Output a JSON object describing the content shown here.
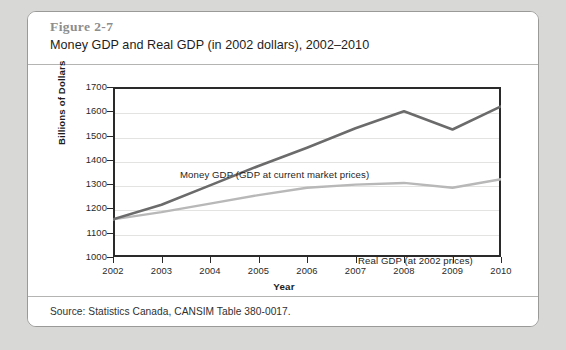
{
  "figure": {
    "number": "Figure 2-7",
    "title": "Money GDP and Real GDP (in 2002 dollars), 2002–2010",
    "source": "Source: Statistics Canada, CANSIM Table 380-0017."
  },
  "chart_data": {
    "type": "line",
    "title": "Money GDP and Real GDP (in 2002 dollars), 2002–2010",
    "xlabel": "Year",
    "ylabel": "Billions of Dollars",
    "categories": [
      2002,
      2003,
      2004,
      2005,
      2006,
      2007,
      2008,
      2009,
      2010
    ],
    "tick_labels_x": [
      "2002",
      "2003",
      "2004",
      "2005",
      "2006",
      "2007",
      "2008",
      "2009",
      "2010"
    ],
    "tick_labels_y": [
      "1000",
      "1100",
      "1200",
      "1300",
      "1400",
      "1500",
      "1600",
      "1700"
    ],
    "ylim": [
      1000,
      1700
    ],
    "ytick_step": 100,
    "grid": true,
    "legend": "inline-annotations",
    "series": [
      {
        "name": "Money GDP (GDP at current market prices)",
        "color": "#6b6b6b",
        "width": 2.6,
        "values": [
          1155,
          1215,
          1295,
          1375,
          1450,
          1530,
          1600,
          1525,
          1620
        ]
      },
      {
        "name": "Real GDP  (at 2002 prices)",
        "color": "#b8b8b8",
        "width": 2.4,
        "values": [
          1155,
          1185,
          1220,
          1255,
          1285,
          1298,
          1305,
          1285,
          1320
        ]
      }
    ],
    "annotations": [
      {
        "text": "Money GDP (GDP at current market prices)",
        "series": 0
      },
      {
        "text": "Real GDP  (at 2002 prices)",
        "series": 1
      }
    ]
  }
}
